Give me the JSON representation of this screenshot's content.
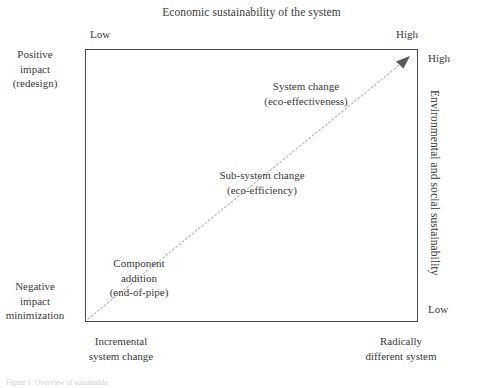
{
  "figure": {
    "top_axis_title": "Economic sustainability of the system",
    "right_axis_title": "Environmental and social sustainability",
    "caption": "Figure 1. Overview of sustainable",
    "scales": {
      "top_low": "Low",
      "top_high": "High",
      "right_high": "High",
      "right_low": "Low"
    },
    "left_axis": {
      "top_line1": "Positive",
      "top_line2": "impact",
      "top_line3": "(redesign)",
      "bottom_line1": "Negative",
      "bottom_line2": "impact",
      "bottom_line3": "minimization"
    },
    "bottom_axis": {
      "left_line1": "Incremental",
      "left_line2": "system change",
      "right_line1": "Radically",
      "right_line2": "different system"
    },
    "nodes": [
      {
        "id": "component-addition",
        "line1": "Component",
        "line2": "addition",
        "line3": "(end-of-pipe)"
      },
      {
        "id": "sub-system-change",
        "line1": "Sub-system change",
        "line2": "(eco-efficiency)"
      },
      {
        "id": "system-change",
        "line1": "System change",
        "line2": "(eco-effectiveness)"
      }
    ],
    "colors": {
      "frame": "#4a4a4a",
      "text": "#3a3a3a",
      "trend_line": "#b9b9b9",
      "arrow_head": "#555555"
    },
    "trend": {
      "label": "dotted diagonal progression arrow",
      "from": "bottom-left",
      "to": "top-right"
    }
  }
}
